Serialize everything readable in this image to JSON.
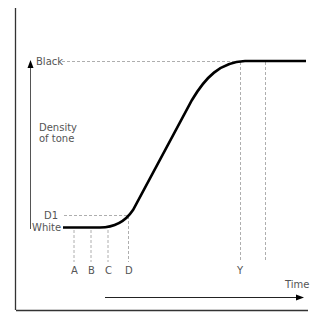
{
  "diagram": {
    "y_axis": {
      "top_label": "Black",
      "bottom_label": "White",
      "title_line1": "Density",
      "title_line2": "of tone",
      "d1_label": "D1"
    },
    "x_axis": {
      "title": "Time"
    },
    "markers": [
      "A",
      "B",
      "C",
      "D",
      "Y"
    ],
    "colors": {
      "curve": "#000000",
      "guides": "#999999",
      "text": "#555555",
      "frame": "#333333"
    }
  }
}
